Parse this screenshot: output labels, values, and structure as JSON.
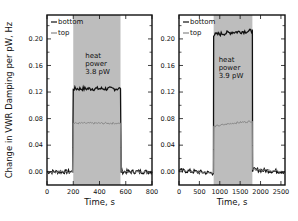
{
  "chart_data": [
    {
      "type": "line",
      "panel": "left",
      "title": "",
      "xlabel": "Time, s",
      "ylabel": "Change in VWR Damping per pW, Hz",
      "xlim": [
        0,
        800
      ],
      "ylim": [
        -0.02,
        0.236
      ],
      "xticks": [
        0,
        200,
        400,
        600,
        800
      ],
      "xtick_labels": [
        "0",
        "200",
        "400",
        "600",
        "800"
      ],
      "yticks": [
        0.0,
        0.04,
        0.08,
        0.12,
        0.16,
        0.2
      ],
      "ytick_labels": [
        "0.00",
        "0.04",
        "0.08",
        "0.12",
        "0.16",
        "0.20"
      ],
      "shaded_region": {
        "x0": 200,
        "x1": 560,
        "color": "#bdbdbd"
      },
      "annotation": {
        "lines": [
          "heat",
          "power",
          "3.8 pW"
        ]
      },
      "legend": [
        {
          "name": "bottom",
          "color": "#111111"
        },
        {
          "name": "top",
          "color": "#888888"
        }
      ],
      "series": [
        {
          "name": "bottom",
          "color": "#111111",
          "x": [
            0,
            195,
            200,
            560,
            565,
            800
          ],
          "values": [
            0.0,
            0.0,
            0.125,
            0.125,
            0.0,
            0.0
          ]
        },
        {
          "name": "top",
          "color": "#888888",
          "x": [
            0,
            195,
            200,
            560,
            565,
            800
          ],
          "values": [
            0.0,
            0.0,
            0.073,
            0.073,
            0.0,
            0.0
          ]
        }
      ]
    },
    {
      "type": "line",
      "panel": "right",
      "title": "",
      "xlabel": "Time, s",
      "ylabel": "",
      "xlim": [
        0,
        2600
      ],
      "ylim": [
        -0.02,
        0.236
      ],
      "xticks": [
        0,
        500,
        1000,
        1500,
        2000,
        2500
      ],
      "xtick_labels": [
        "0",
        "500",
        "1000",
        "1500",
        "2000",
        "2500"
      ],
      "yticks": [
        0.0,
        0.04,
        0.08,
        0.12,
        0.16,
        0.2
      ],
      "ytick_labels": [
        "0.00",
        "0.04",
        "0.08",
        "0.12",
        "0.16",
        "0.20"
      ],
      "shaded_region": {
        "x0": 850,
        "x1": 1800,
        "color": "#bdbdbd"
      },
      "annotation": {
        "lines": [
          "heat",
          "power",
          "3.9 pW"
        ]
      },
      "legend": [
        {
          "name": "bottom",
          "color": "#111111"
        },
        {
          "name": "top",
          "color": "#888888"
        }
      ],
      "series": [
        {
          "name": "bottom",
          "color": "#111111",
          "x": [
            0,
            845,
            850,
            1300,
            1800,
            1805,
            2600
          ],
          "values": [
            0.002,
            -0.002,
            0.206,
            0.21,
            0.212,
            0.003,
            0.0
          ]
        },
        {
          "name": "top",
          "color": "#888888",
          "x": [
            0,
            845,
            850,
            1300,
            1800,
            1805,
            2600
          ],
          "values": [
            0.002,
            -0.002,
            0.068,
            0.073,
            0.076,
            0.004,
            0.0
          ]
        }
      ]
    }
  ]
}
